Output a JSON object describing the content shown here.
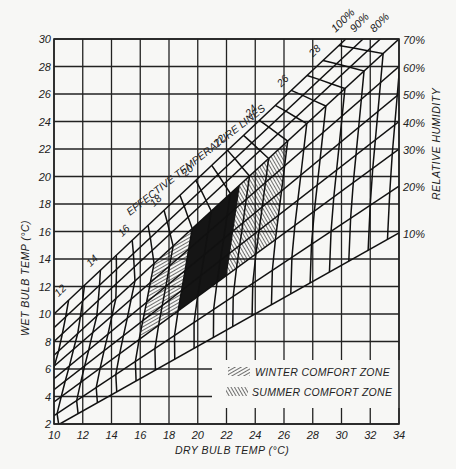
{
  "chart_data": {
    "type": "line",
    "title": "",
    "xlabel": "DRY BULB TEMP (°C)",
    "ylabel": "WET BULB TEMP (°C)",
    "right_label": "RELATIVE HUMIDITY",
    "xlim": [
      10,
      34
    ],
    "ylim": [
      2,
      30
    ],
    "x_ticks": [
      10,
      12,
      14,
      16,
      18,
      20,
      22,
      24,
      26,
      28,
      30,
      32,
      34
    ],
    "y_ticks": [
      2,
      4,
      6,
      8,
      10,
      12,
      14,
      16,
      18,
      20,
      22,
      24,
      26,
      28,
      30
    ],
    "grid": true,
    "annotation": "EFFECTIVE TEMPERATURE LINES",
    "relative_humidity_lines": [
      {
        "label": "100%",
        "from": [
          10,
          10
        ],
        "to": [
          30.3,
          30
        ]
      },
      {
        "label": "90%",
        "from": [
          10,
          9
        ],
        "to": [
          31.5,
          30
        ]
      },
      {
        "label": "80%",
        "from": [
          10,
          8
        ],
        "to": [
          32.7,
          30
        ]
      },
      {
        "label": "70%",
        "from": [
          10,
          7
        ],
        "to": [
          34,
          30
        ]
      },
      {
        "label": "60%",
        "from": [
          10,
          6.2
        ],
        "to": [
          34,
          28
        ]
      },
      {
        "label": "50%",
        "from": [
          10,
          5.3
        ],
        "to": [
          34,
          26
        ]
      },
      {
        "label": "40%",
        "from": [
          10,
          4.5
        ],
        "to": [
          34,
          24
        ]
      },
      {
        "label": "30%",
        "from": [
          10,
          3.6
        ],
        "to": [
          34,
          22
        ]
      },
      {
        "label": "20%",
        "from": [
          10,
          2.6
        ],
        "to": [
          34,
          19.3
        ]
      },
      {
        "label": "10%",
        "from": [
          10.4,
          2
        ],
        "to": [
          34,
          15.9
        ]
      }
    ],
    "effective_temperature_lines": [
      12,
      13,
      14,
      15,
      16,
      17,
      18,
      19,
      20,
      21,
      22,
      23,
      24,
      25,
      26,
      27,
      28,
      29,
      30
    ],
    "effective_temperature_labels": [
      12,
      14,
      16,
      18,
      20,
      22,
      24,
      26,
      28
    ],
    "zones": [
      {
        "name": "WINTER COMFORT ZONE",
        "hatch": "forward-diagonal",
        "et_range": [
          17,
          21.5
        ],
        "rh_range": [
          30,
          70
        ]
      },
      {
        "name": "SUMMER COMFORT ZONE",
        "hatch": "backward-diagonal",
        "et_range": [
          19,
          24
        ],
        "rh_range": [
          30,
          70
        ]
      }
    ],
    "legend": [
      "WINTER COMFORT ZONE",
      "SUMMER COMFORT ZONE"
    ],
    "legend_position": "lower-right"
  },
  "axes": {
    "xlabel": "DRY BULB TEMP (°C)",
    "ylabel": "WET BULB TEMP (°C)",
    "right_label": "RELATIVE HUMIDITY",
    "x_ticks": [
      "10",
      "12",
      "14",
      "16",
      "18",
      "20",
      "22",
      "24",
      "26",
      "28",
      "30",
      "32",
      "34"
    ],
    "y_ticks": [
      "2",
      "4",
      "6",
      "8",
      "10",
      "12",
      "14",
      "16",
      "18",
      "20",
      "22",
      "24",
      "26",
      "28",
      "30"
    ],
    "rh_right_labels": [
      "70%",
      "60%",
      "50%",
      "40%",
      "30%",
      "20%",
      "10%"
    ],
    "rh_top_labels": [
      "100%",
      "90%",
      "80%"
    ]
  },
  "annotation": "EFFECTIVE TEMPERATURE LINES",
  "et_labels": [
    "12",
    "14",
    "16",
    "18",
    "20",
    "22",
    "24",
    "26",
    "28"
  ],
  "legend": {
    "winter": "WINTER COMFORT ZONE",
    "summer": "SUMMER COMFORT ZONE"
  }
}
